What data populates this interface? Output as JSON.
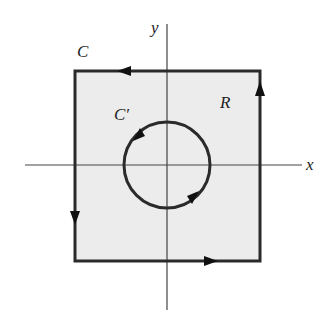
{
  "diagram": {
    "labels": {
      "x_axis": "x",
      "y_axis": "y",
      "outer_curve": "C",
      "inner_curve": "C′",
      "region": "R"
    },
    "colors": {
      "region_fill": "#ececec",
      "stroke": "#2a2a2a",
      "axis": "#444444"
    }
  }
}
